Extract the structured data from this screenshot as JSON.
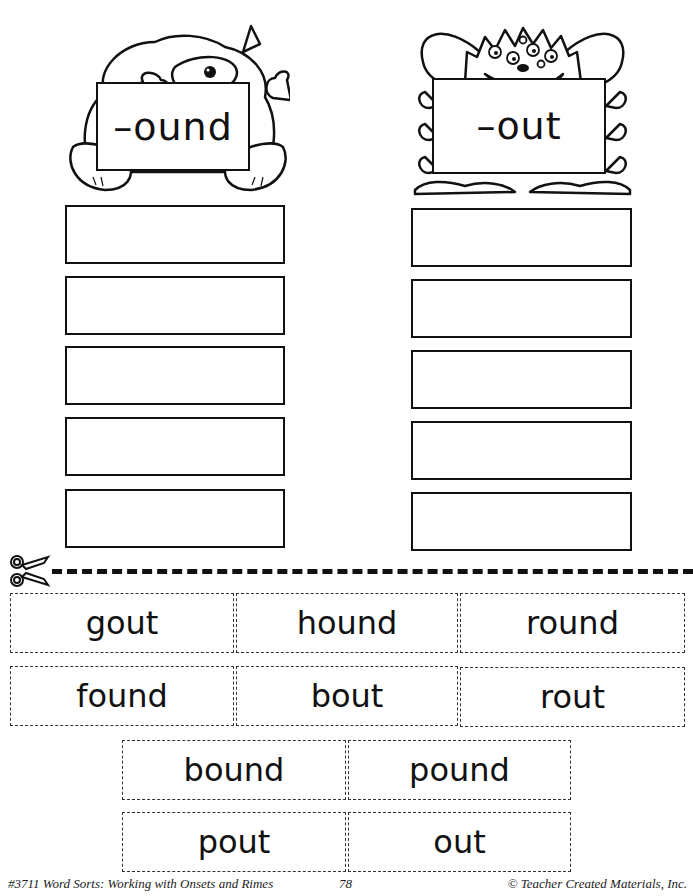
{
  "left_column": {
    "header_label": "–ound",
    "monster": "one-eyed furry monster holding sign",
    "answer_boxes": [
      "",
      "",
      "",
      "",
      ""
    ]
  },
  "right_column": {
    "header_label": "–out",
    "monster": "many-eyed grinning monster holding sign",
    "answer_boxes": [
      "",
      "",
      "",
      "",
      ""
    ]
  },
  "cut_line": {
    "icon": "scissors-icon"
  },
  "word_cards": {
    "row1": [
      "gout",
      "hound",
      "round"
    ],
    "row2": [
      "found",
      "bout",
      "rout"
    ],
    "row3": [
      "bound",
      "pound"
    ],
    "row4": [
      "pout",
      "out"
    ]
  },
  "footer": {
    "left": "#3711 Word Sorts:  Working with Onsets and Rimes",
    "page_number": "78",
    "right": "© Teacher Created Materials, Inc."
  }
}
